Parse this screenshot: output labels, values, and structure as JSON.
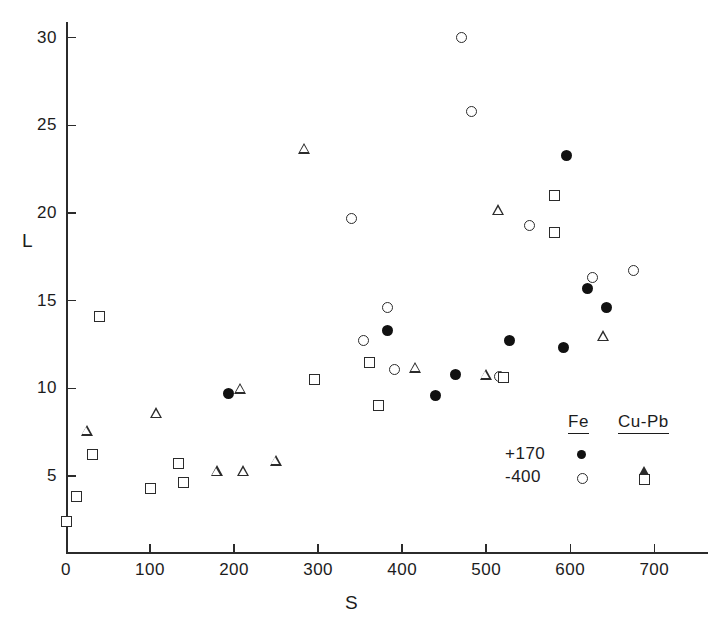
{
  "chart_data": {
    "type": "scatter",
    "title": "",
    "xlabel": "S",
    "ylabel": "L",
    "xlim": [
      0,
      760
    ],
    "ylim": [
      0,
      32
    ],
    "grid": false,
    "xticks": [
      0,
      100,
      200,
      300,
      400,
      500,
      600,
      700
    ],
    "yticks": [
      5,
      10,
      15,
      20,
      25,
      30
    ],
    "xtick_labels": [
      "0",
      "100",
      "200",
      "300",
      "400",
      "500",
      "600",
      "700"
    ],
    "ytick_labels": [
      "5",
      "10",
      "15",
      "20",
      "25",
      "30"
    ],
    "legend": {
      "position": "lower-right",
      "columns": [
        "Fe",
        "Cu-Pb"
      ],
      "rows": [
        {
          "label": "+170",
          "fe_marker": "filled-circle",
          "cupb_marker": "open-triangle"
        },
        {
          "label": "-400",
          "fe_marker": "open-circle",
          "cupb_marker": "open-square"
        }
      ]
    },
    "series": [
      {
        "name": "Fe +170",
        "marker": "filled-circle",
        "points": [
          [
            193,
            9.7
          ],
          [
            383,
            13.3
          ],
          [
            440,
            9.6
          ],
          [
            463,
            10.8
          ],
          [
            528,
            12.7
          ],
          [
            592,
            12.3
          ],
          [
            595,
            23.3
          ],
          [
            621,
            15.7
          ],
          [
            643,
            14.6
          ]
        ]
      },
      {
        "name": "Fe -400",
        "marker": "open-circle",
        "points": [
          [
            340,
            19.7
          ],
          [
            354,
            12.7
          ],
          [
            382,
            14.6
          ],
          [
            391,
            11.1
          ],
          [
            470,
            30.0
          ],
          [
            483,
            25.8
          ],
          [
            516,
            10.7
          ],
          [
            551,
            19.3
          ],
          [
            627,
            16.3
          ],
          [
            675,
            16.7
          ]
        ]
      },
      {
        "name": "Cu-Pb +170",
        "marker": "open-triangle",
        "points": [
          [
            25,
            7.6
          ],
          [
            108,
            8.6
          ],
          [
            180,
            5.3
          ],
          [
            208,
            10.0
          ],
          [
            211,
            5.3
          ],
          [
            250,
            5.9
          ],
          [
            284,
            23.7
          ],
          [
            416,
            11.2
          ],
          [
            500,
            10.8
          ],
          [
            515,
            20.2
          ],
          [
            640,
            13.0
          ]
        ]
      },
      {
        "name": "Cu-Pb -400",
        "marker": "open-square",
        "points": [
          [
            1,
            2.4
          ],
          [
            13,
            3.8
          ],
          [
            31,
            6.2
          ],
          [
            40,
            14.1
          ],
          [
            100,
            4.3
          ],
          [
            134,
            5.7
          ],
          [
            140,
            4.6
          ],
          [
            296,
            10.5
          ],
          [
            372,
            9.0
          ],
          [
            361,
            11.5
          ],
          [
            521,
            10.6
          ],
          [
            581,
            21.0
          ],
          [
            581,
            18.9
          ]
        ]
      }
    ]
  }
}
